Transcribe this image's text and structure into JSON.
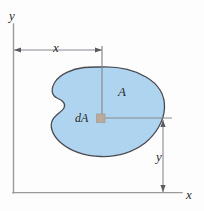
{
  "figure": {
    "background_color": "#fdfdfd",
    "labels": {
      "axis_y": "y",
      "axis_x": "x",
      "dim_x": "x",
      "dim_y": "y",
      "area": "A",
      "area_element": "dA"
    },
    "colors": {
      "area_fill": "#aed4f0",
      "area_outline": "#4a4a52",
      "axis": "#9a9a9a",
      "dimension_line": "#8a8a92",
      "element_marker": "#b9aa9c",
      "text": "#2a2a2a"
    },
    "geometry": {
      "axis_origin": [
        13,
        193
      ],
      "axis_y_top": [
        13,
        24
      ],
      "axis_x_right": [
        182,
        193
      ],
      "dim_x_line_y": 50,
      "dim_x_from": 14,
      "dim_x_to": 102,
      "dim_y_line_x": 163,
      "dim_y_from": 120,
      "dim_y_to": 192,
      "element_marker": [
        100,
        118
      ],
      "element_marker_size": 8,
      "leader_vertical_from": [
        102,
        50
      ],
      "leader_horizontal_to": [
        172,
        118
      ]
    }
  }
}
